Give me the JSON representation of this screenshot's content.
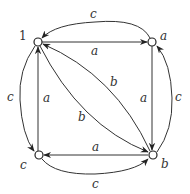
{
  "diagram": {
    "title": "",
    "colors": {
      "stroke": "#333333",
      "background": "#ffffff",
      "node_fill": "#ffffff"
    },
    "nodes": [
      {
        "id": "n1",
        "label": "1"
      },
      {
        "id": "na",
        "label": "a"
      },
      {
        "id": "nc",
        "label": "c"
      },
      {
        "id": "nb",
        "label": "b"
      }
    ],
    "edges": [
      {
        "from": "1",
        "to": "a",
        "label": "a"
      },
      {
        "from": "a",
        "to": "b",
        "label": "a"
      },
      {
        "from": "b",
        "to": "c",
        "label": "a"
      },
      {
        "from": "c",
        "to": "1",
        "label": "a"
      },
      {
        "from": "1",
        "to": "b",
        "label": "b"
      },
      {
        "from": "b",
        "to": "1",
        "label": "b"
      },
      {
        "from": "a",
        "to": "1",
        "label": "c"
      },
      {
        "from": "1",
        "to": "c",
        "label": "c"
      },
      {
        "from": "c",
        "to": "b",
        "label": "c"
      },
      {
        "from": "b",
        "to": "a",
        "label": "c"
      }
    ]
  }
}
